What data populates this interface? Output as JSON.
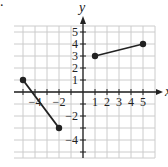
{
  "problem": {
    "label": "."
  },
  "chart_data": {
    "type": "line",
    "title": "",
    "xlabel": "x",
    "ylabel": "y",
    "xlim": [
      -5.75,
      6
    ],
    "ylim": [
      -5.5,
      6
    ],
    "grid": true,
    "x_ticks": [
      -4,
      -2,
      1,
      2,
      3,
      4,
      5
    ],
    "y_ticks": [
      5,
      4,
      3,
      2,
      1,
      -2,
      -4
    ],
    "x_tick_labels": [
      "−4",
      "−2",
      "1",
      "2",
      "3",
      "4",
      "5"
    ],
    "y_tick_labels": [
      "5",
      "4",
      "3",
      "2",
      "1",
      "−2",
      "−4"
    ],
    "series": [
      {
        "name": "segment-left",
        "points": [
          [
            -5,
            1
          ],
          [
            -2,
            -3
          ]
        ],
        "endpoints": "closed"
      },
      {
        "name": "segment-right",
        "points": [
          [
            1,
            3
          ],
          [
            5,
            4
          ]
        ],
        "endpoints": "closed"
      }
    ],
    "colors": {
      "grid": "#cccccc",
      "axis": "#222222",
      "line": "#222222"
    }
  }
}
